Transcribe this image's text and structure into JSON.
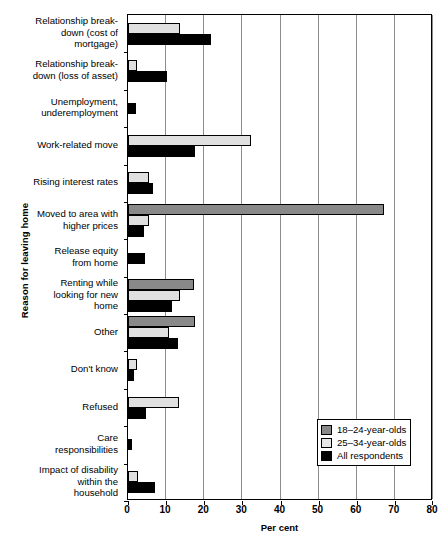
{
  "chart_data": {
    "type": "bar",
    "orientation": "horizontal",
    "title": "",
    "xlabel": "Per cent",
    "ylabel": "Reason for leaving home",
    "xlim": [
      0,
      80
    ],
    "xticks": [
      0,
      10,
      20,
      30,
      40,
      50,
      60,
      70,
      80
    ],
    "grid": true,
    "legend_position": "lower-right-inside",
    "categories": [
      "Relationship break-\ndown (cost of\nmortgage)",
      "Relationship break-\ndown (loss of asset)",
      "Unemployment,\nunderemployment",
      "Work-related move",
      "Rising interest rates",
      "Moved to area with\nhigher prices",
      "Release equity\nfrom home",
      "Renting while\nlooking for new\nhome",
      "Other",
      "Don't know",
      "Refused",
      "Care\nresponsibilities",
      "Impact of disability\nwithin the\nhousehold"
    ],
    "series": [
      {
        "name": "18–24-year-olds",
        "color": "#898989",
        "values": [
          0,
          0,
          0,
          0,
          0,
          67.2,
          0,
          17.3,
          17.6,
          0,
          0,
          0,
          0
        ]
      },
      {
        "name": "25–34-year-olds",
        "color": "#e0e0e0",
        "values": [
          13.6,
          2.4,
          0,
          32.3,
          5.5,
          5.5,
          0,
          13.7,
          10.8,
          2.3,
          13.4,
          0,
          2.7
        ]
      },
      {
        "name": "All respondents",
        "color": "#000000",
        "values": [
          21.8,
          10.2,
          2.1,
          17.6,
          6.5,
          4.2,
          4.5,
          11.6,
          13.1,
          1.5,
          4.7,
          1.0,
          7.1
        ]
      }
    ]
  },
  "axis": {
    "x_title": "Per cent",
    "y_title": "Reason for leaving home",
    "x_tick_labels": [
      "0",
      "10",
      "20",
      "30",
      "40",
      "50",
      "60",
      "70",
      "80"
    ]
  },
  "legend": {
    "items": [
      {
        "label": "18–24-year-olds",
        "swatch": "legend-swatch-18-24"
      },
      {
        "label": "25–34-year-olds",
        "swatch": "legend-swatch-25-34"
      },
      {
        "label": "All respondents",
        "swatch": "legend-swatch-all"
      }
    ]
  }
}
